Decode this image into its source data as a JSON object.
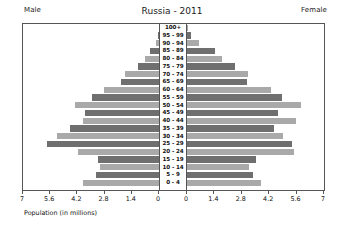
{
  "header": {
    "male_label": "Male",
    "female_label": "Female",
    "title": "Russia - 2011"
  },
  "axis_caption": "Population (in millions)",
  "colors": {
    "bar_dark": "#6f6f6f",
    "bar_light": "#a9a9a9",
    "frame": "#555555",
    "background": "#ffffff"
  },
  "chart_data": {
    "type": "bar",
    "subtype": "population-pyramid",
    "title": "Russia - 2011",
    "xlabel": "Population (in millions)",
    "ylabel": "",
    "grid": false,
    "legend_position": "top",
    "left_axis": {
      "name": "Male",
      "ticks": [
        "7",
        "5.6",
        "4.2",
        "2.8",
        "1.4",
        "0"
      ],
      "tick_values": [
        7,
        5.6,
        4.2,
        2.8,
        1.4,
        0
      ],
      "range": [
        7,
        0
      ],
      "direction": "right-to-left"
    },
    "right_axis": {
      "name": "Female",
      "ticks": [
        "0",
        "1.4",
        "2.8",
        "4.2",
        "5.6",
        "7"
      ],
      "tick_values": [
        0,
        1.4,
        2.8,
        4.2,
        5.6,
        7
      ],
      "range": [
        0,
        7
      ],
      "direction": "left-to-right"
    },
    "categories": [
      "100+",
      "95 - 99",
      "90 - 94",
      "85 - 89",
      "80 - 84",
      "75 - 79",
      "70 - 74",
      "65 - 69",
      "60 - 64",
      "55 - 59",
      "50 - 54",
      "45 - 49",
      "40 - 44",
      "35 - 39",
      "30 - 34",
      "25 - 29",
      "20 - 24",
      "15 - 19",
      "10 - 14",
      "5 - 9",
      "0 - 4"
    ],
    "series": [
      {
        "name": "Male",
        "side": "left",
        "unit": "millions",
        "values": [
          0.01,
          0.06,
          0.17,
          0.48,
          0.7,
          1.1,
          1.75,
          1.95,
          2.85,
          3.45,
          4.35,
          3.8,
          3.9,
          4.6,
          5.25,
          5.75,
          4.15,
          3.15,
          3.05,
          3.25,
          3.9
        ]
      },
      {
        "name": "Female",
        "side": "right",
        "unit": "millions",
        "values": [
          0.03,
          0.22,
          0.62,
          1.45,
          1.8,
          2.45,
          3.1,
          3.05,
          4.3,
          4.85,
          5.85,
          4.65,
          5.55,
          4.45,
          4.9,
          5.35,
          5.45,
          3.55,
          3.15,
          3.35,
          3.8
        ]
      }
    ]
  }
}
